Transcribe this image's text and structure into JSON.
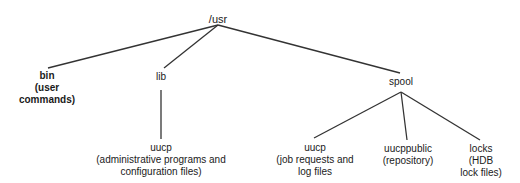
{
  "diagram": {
    "type": "directory-tree",
    "root": {
      "id": "usr",
      "label": "/usr",
      "x": 218,
      "y": 13
    },
    "nodes": [
      {
        "id": "bin",
        "label": "bin",
        "description_lines": [
          "(user",
          "commands)"
        ],
        "x": 47,
        "y": 70,
        "bold": true
      },
      {
        "id": "lib",
        "label": "lib",
        "description_lines": [],
        "x": 161,
        "y": 71,
        "bold": false
      },
      {
        "id": "spool",
        "label": "spool",
        "description_lines": [],
        "x": 401,
        "y": 76,
        "bold": false
      },
      {
        "id": "lib-uucp",
        "label": "uucp",
        "description_lines": [
          "(administrative programs and",
          "configuration files)"
        ],
        "x": 161,
        "y": 142,
        "bold": false
      },
      {
        "id": "spool-uucp",
        "label": "uucp",
        "description_lines": [
          "(job requests and",
          "log files"
        ],
        "x": 315,
        "y": 142,
        "bold": false
      },
      {
        "id": "uucppublic",
        "label": "uucppublic",
        "description_lines": [
          "(repository)"
        ],
        "x": 408,
        "y": 143,
        "bold": false
      },
      {
        "id": "locks",
        "label": "locks",
        "description_lines": [
          "(HDB",
          "lock files)"
        ],
        "x": 481,
        "y": 143,
        "bold": false
      }
    ],
    "edges": [
      {
        "from": "usr",
        "to": "bin",
        "x1": 218,
        "y1": 25,
        "x2": 48,
        "y2": 68
      },
      {
        "from": "usr",
        "to": "lib",
        "x1": 218,
        "y1": 25,
        "x2": 164,
        "y2": 68
      },
      {
        "from": "usr",
        "to": "spool",
        "x1": 218,
        "y1": 25,
        "x2": 400,
        "y2": 73
      },
      {
        "from": "lib",
        "to": "lib-uucp",
        "x1": 161,
        "y1": 90,
        "x2": 161,
        "y2": 139
      },
      {
        "from": "spool",
        "to": "spool-uucp",
        "x1": 401,
        "y1": 92,
        "x2": 314,
        "y2": 138
      },
      {
        "from": "spool",
        "to": "uucppublic",
        "x1": 401,
        "y1": 92,
        "x2": 407,
        "y2": 140
      },
      {
        "from": "spool",
        "to": "locks",
        "x1": 401,
        "y1": 92,
        "x2": 480,
        "y2": 140
      }
    ]
  }
}
